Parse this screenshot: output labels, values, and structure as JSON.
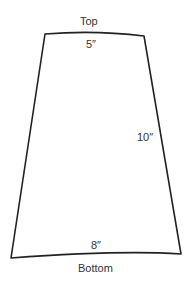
{
  "diagram": {
    "shape": "trapezoid",
    "labels": {
      "top": "Top",
      "bottom": "Bottom",
      "top_width": "5″",
      "side_height": "10″",
      "bottom_width": "8″"
    },
    "stroke_color": "#222222"
  }
}
